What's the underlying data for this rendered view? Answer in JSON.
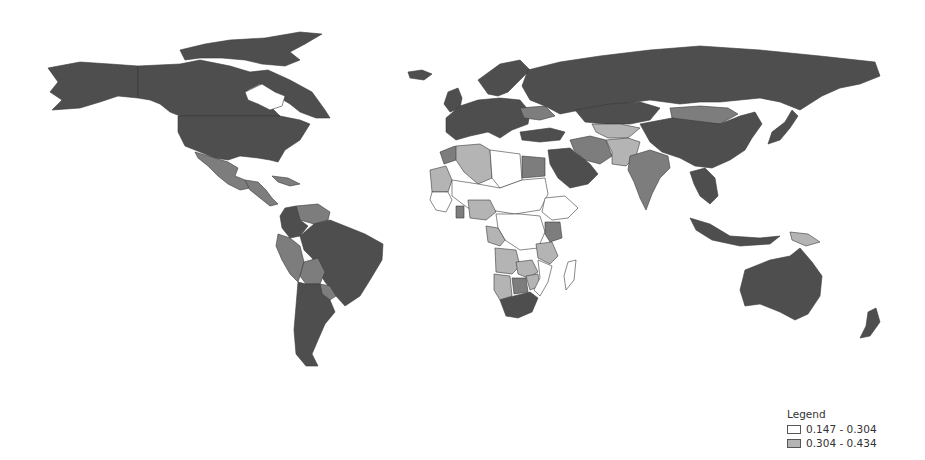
{
  "map": {
    "type": "choropleth",
    "classes": [
      {
        "id": "c1",
        "label": "0.147 - 0.304",
        "color": "#ffffff"
      },
      {
        "id": "c2",
        "label": "0.304 - 0.434",
        "color": "#b4b4b4"
      },
      {
        "id": "c3",
        "label": "",
        "color": "#7d7d7d"
      },
      {
        "id": "c4",
        "label": "",
        "color": "#4e4e4e"
      }
    ],
    "regions": [
      {
        "name": "Alaska/USA",
        "class": "c4"
      },
      {
        "name": "Canada",
        "class": "c4"
      },
      {
        "name": "Greenland",
        "class": "c1"
      },
      {
        "name": "Canadian Arctic Islands",
        "class": "c4"
      },
      {
        "name": "United States",
        "class": "c4"
      },
      {
        "name": "Mexico",
        "class": "c3"
      },
      {
        "name": "Central America",
        "class": "c3"
      },
      {
        "name": "Cuba",
        "class": "c3"
      },
      {
        "name": "Iceland",
        "class": "c4"
      },
      {
        "name": "Venezuela",
        "class": "c3"
      },
      {
        "name": "Colombia",
        "class": "c4"
      },
      {
        "name": "Ecuador/Peru",
        "class": "c3"
      },
      {
        "name": "Brazil",
        "class": "c4"
      },
      {
        "name": "Bolivia",
        "class": "c3"
      },
      {
        "name": "Paraguay",
        "class": "c3"
      },
      {
        "name": "Argentina/Chile",
        "class": "c4"
      },
      {
        "name": "Western Europe",
        "class": "c4"
      },
      {
        "name": "Scandinavia",
        "class": "c4"
      },
      {
        "name": "UK/Ireland",
        "class": "c4"
      },
      {
        "name": "Ukraine",
        "class": "c3"
      },
      {
        "name": "Russia",
        "class": "c4"
      },
      {
        "name": "Kazakhstan",
        "class": "c4"
      },
      {
        "name": "Mongolia",
        "class": "c3"
      },
      {
        "name": "China",
        "class": "c4"
      },
      {
        "name": "Japan",
        "class": "c4"
      },
      {
        "name": "Turkey",
        "class": "c4"
      },
      {
        "name": "Iran",
        "class": "c3"
      },
      {
        "name": "Central Asia",
        "class": "c2"
      },
      {
        "name": "Afghanistan/Pakistan",
        "class": "c2"
      },
      {
        "name": "Saudi Arabia",
        "class": "c4"
      },
      {
        "name": "India",
        "class": "c3"
      },
      {
        "name": "Southeast Asia",
        "class": "c4"
      },
      {
        "name": "Indonesia",
        "class": "c4"
      },
      {
        "name": "Papua New Guinea",
        "class": "c2"
      },
      {
        "name": "Morocco",
        "class": "c3"
      },
      {
        "name": "Algeria",
        "class": "c2"
      },
      {
        "name": "Libya",
        "class": "c1"
      },
      {
        "name": "Egypt",
        "class": "c3"
      },
      {
        "name": "Mauritania",
        "class": "c2"
      },
      {
        "name": "Mali/Niger/Chad/Sudan",
        "class": "c1"
      },
      {
        "name": "West Africa coast",
        "class": "c1"
      },
      {
        "name": "Ghana",
        "class": "c3"
      },
      {
        "name": "Nigeria",
        "class": "c2"
      },
      {
        "name": "Ethiopia/Somalia",
        "class": "c1"
      },
      {
        "name": "Central Africa",
        "class": "c1"
      },
      {
        "name": "Gabon/Congo",
        "class": "c2"
      },
      {
        "name": "Kenya",
        "class": "c3"
      },
      {
        "name": "Tanzania",
        "class": "c2"
      },
      {
        "name": "Angola",
        "class": "c2"
      },
      {
        "name": "Zambia",
        "class": "c2"
      },
      {
        "name": "Namibia",
        "class": "c2"
      },
      {
        "name": "Botswana",
        "class": "c3"
      },
      {
        "name": "Zimbabwe",
        "class": "c2"
      },
      {
        "name": "Mozambique",
        "class": "c1"
      },
      {
        "name": "South Africa",
        "class": "c4"
      },
      {
        "name": "Madagascar",
        "class": "c1"
      },
      {
        "name": "Australia",
        "class": "c4"
      },
      {
        "name": "New Zealand",
        "class": "c4"
      }
    ]
  },
  "legend": {
    "title": "Legend",
    "entries": [
      {
        "label": "0.147 - 0.304",
        "color": "#ffffff"
      },
      {
        "label": "0.304 - 0.434",
        "color": "#b4b4b4"
      }
    ]
  }
}
